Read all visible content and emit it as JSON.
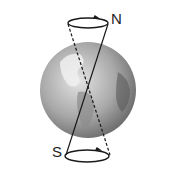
{
  "diagram": {
    "labels": {
      "north": "N",
      "south": "S"
    },
    "colors": {
      "globe_light": "#d8d8d8",
      "globe_dark": "#6e6e6e",
      "land": "#f2f2f2",
      "line": "#1a1a1a"
    }
  }
}
